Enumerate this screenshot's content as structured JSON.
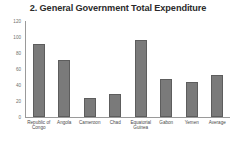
{
  "chart_data": {
    "type": "bar",
    "title": "2. General Government Total Expenditure",
    "xlabel": "",
    "ylabel": "",
    "ylim": [
      0,
      120
    ],
    "yticks": [
      0,
      20,
      40,
      60,
      80,
      100,
      120
    ],
    "ytick_labels": [
      "0",
      "20",
      "40",
      "60",
      "80",
      "100",
      "120"
    ],
    "grid": false,
    "legend": false,
    "categories": [
      "Republic of Congo",
      "Angola",
      "Cameroon",
      "Chad",
      "Equatorial Guinea",
      "Gabon",
      "Yemen",
      "Average"
    ],
    "values": [
      91,
      71,
      24,
      29,
      96,
      47,
      44,
      52
    ],
    "bar_color": "#7a7a7a",
    "bar_edge_color": "#5d5d5d",
    "axis_color": "#9a9a9a",
    "title_color": "#2b2b2b",
    "tick_label_color": "#6e6e6e"
  }
}
